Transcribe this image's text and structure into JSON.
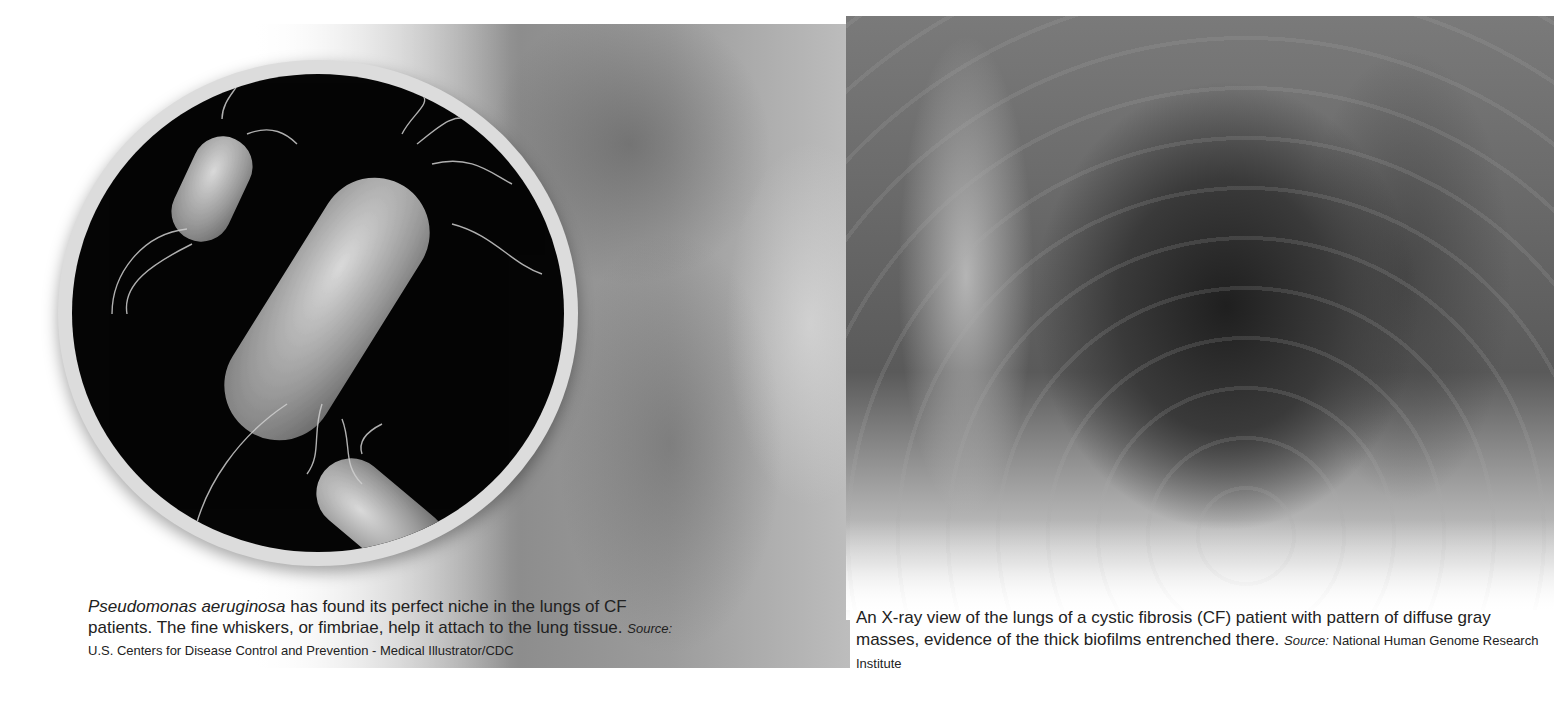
{
  "images": {
    "microscope": {
      "subject": "Pseudomonas aeruginosa bacteria (scanning electron micrograph illustration)"
    },
    "xray": {
      "subject": "Chest X-ray of cystic fibrosis patient lungs"
    }
  },
  "captions": {
    "left": {
      "species": "Pseudomonas aeruginosa",
      "text": " has found its perfect niche in the lungs of CF patients. The fine whiskers, or fimbriae, help it attach to the lung tissue. ",
      "source_label": "Source:",
      "source": " U.S. Centers for Disease Control and Prevention - Medical Illustrator/CDC"
    },
    "right": {
      "text": "An X-ray view of the lungs of a cystic fibrosis (CF) patient with pattern of diffuse gray masses, evidence of the thick biofilms entrenched there. ",
      "source_label": "Source:",
      "source": " National Human Genome Research Institute"
    }
  }
}
